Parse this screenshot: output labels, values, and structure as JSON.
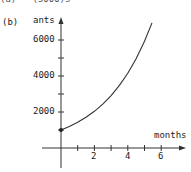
{
  "header": {
    "cut_text": "(a)   (5000)s"
  },
  "panel_label": "(b)",
  "chart_data": {
    "type": "line",
    "title": "",
    "xlabel": "months",
    "ylabel": "ants",
    "x_ticks": [
      1,
      2,
      3,
      4,
      5,
      6
    ],
    "x_tick_labels": [
      "2",
      "4",
      "6"
    ],
    "y_ticks": [
      1000,
      2000,
      3000,
      4000,
      5000,
      6000
    ],
    "y_tick_labels": [
      "2000",
      "4000",
      "6000"
    ],
    "xlim": [
      -1,
      7.3
    ],
    "ylim": [
      -1000,
      7300
    ],
    "grid": false,
    "legend": null,
    "annotations": [
      "initial point marked at (0, 1000)"
    ],
    "series": [
      {
        "name": "ants",
        "x": [
          0,
          0.5,
          1,
          1.5,
          2,
          2.5,
          3,
          3.5,
          4,
          4.5,
          5,
          5.45
        ],
        "values": [
          1000,
          1195,
          1430,
          1705,
          2040,
          2435,
          2910,
          3480,
          4150,
          4960,
          5930,
          6950
        ]
      }
    ]
  }
}
